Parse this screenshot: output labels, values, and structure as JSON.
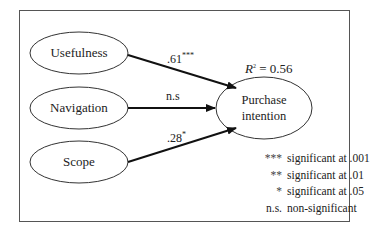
{
  "diagram": {
    "type": "path-model",
    "nodes": {
      "usefulness": {
        "label": "Usefulness"
      },
      "navigation": {
        "label": "Navigation"
      },
      "scope": {
        "label": "Scope"
      },
      "purchase_intention": {
        "label_line1": "Purchase",
        "label_line2": "intention"
      }
    },
    "edges": [
      {
        "from": "Usefulness",
        "to": "Purchase intention",
        "coef": ".61",
        "sig": "***"
      },
      {
        "from": "Navigation",
        "to": "Purchase intention",
        "coef": "n.s",
        "sig": ""
      },
      {
        "from": "Scope",
        "to": "Purchase intention",
        "coef": ".28",
        "sig": "*"
      }
    ],
    "r_squared": {
      "symbol": "R",
      "exponent": "2",
      "text": " = 0.56"
    },
    "legend": [
      {
        "key": "***",
        "text": "significant at .001"
      },
      {
        "key": "**",
        "text": "significant at .01"
      },
      {
        "key": "*",
        "text": "significant at .05"
      },
      {
        "key": "n.s.",
        "text": "non-significant"
      }
    ]
  }
}
